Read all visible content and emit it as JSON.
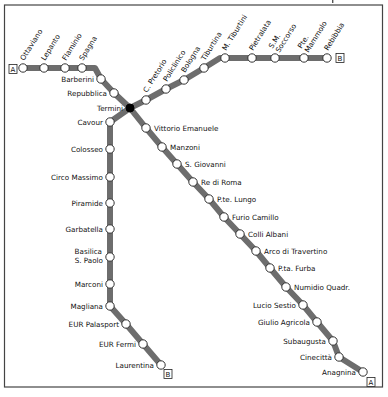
{
  "map": {
    "title": "Rome Metro",
    "line_color": "#6d6d6d",
    "interchange": "Termini",
    "lines": [
      {
        "id": "A",
        "terminal_badge": "A",
        "stations": [
          "Ottaviano",
          "Lepanto",
          "Flaminio",
          "Spagna",
          "Barberini",
          "Repubblica",
          "Termini",
          "Vittorio Emanuele",
          "Manzoni",
          "S. Giovanni",
          "Re di Roma",
          "P.te. Lungo",
          "Furio Camillo",
          "Colli Albani",
          "Arco di Travertino",
          "P.ta. Furba",
          "Numidio Quadr.",
          "Lucio Sestio",
          "Giulio Agricola",
          "Subaugusta",
          "Cinecittà",
          "Anagnina"
        ]
      },
      {
        "id": "B",
        "terminal_badge": "B",
        "stations": [
          "Laurentina",
          "EUR Fermi",
          "EUR Palasport",
          "Magliana",
          "Marconi",
          "Basilica S. Paolo",
          "Garbatella",
          "Piramide",
          "Circo Massimo",
          "Colosseo",
          "Cavour",
          "Termini",
          "C. Pretorio",
          "Policlinico",
          "Bologna",
          "Tiburtina",
          "M. Tiburtini",
          "Pietralata",
          "S.M. Soccorso",
          "Pte. Mammolo",
          "Rebibbia"
        ]
      }
    ]
  }
}
